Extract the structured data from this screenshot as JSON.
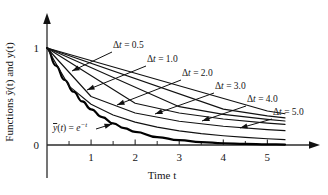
{
  "figure": {
    "background": "#ffffff",
    "ink": "#111111"
  },
  "chart_data": {
    "type": "line",
    "title": "",
    "xlabel": "Time t",
    "ylabel": "Functions ȳ(t) and y(t)",
    "xlim": [
      0,
      5.4
    ],
    "ylim": [
      0,
      1.12
    ],
    "grid": false,
    "legend_position": "inline-annotations",
    "x_ticks_major": [
      1,
      2,
      3,
      4,
      5
    ],
    "x_ticks_minor": [
      0.5,
      1.5,
      2.5,
      3.5,
      4.5
    ],
    "x_tick_labels": [
      "1",
      "2",
      "3",
      "4",
      "5"
    ],
    "y_ticks_major": [
      0,
      1
    ],
    "y_tick_labels": [
      "0",
      "1"
    ],
    "series": [
      {
        "name": "ȳ(t) = e^-t",
        "label": "ȳ(t) = e⁻t",
        "style": "exact-bold",
        "x": [
          0,
          0.2,
          0.4,
          0.6,
          0.8,
          1.0,
          1.25,
          1.5,
          1.75,
          2.0,
          2.5,
          3.0,
          3.5,
          4.0,
          4.5,
          5.0,
          5.4
        ],
        "values": [
          1.0,
          0.819,
          0.67,
          0.549,
          0.449,
          0.368,
          0.287,
          0.223,
          0.174,
          0.135,
          0.082,
          0.05,
          0.03,
          0.018,
          0.011,
          0.007,
          0.0045
        ]
      },
      {
        "name": "Δt = 0.5",
        "label": "Δt = 0.5",
        "style": "euler",
        "x": [
          0,
          0.5,
          1.0,
          1.5,
          2.0,
          2.5,
          3.0,
          3.5,
          4.0,
          4.5,
          5.0,
          5.4
        ],
        "values": [
          1.0,
          0.607,
          0.42,
          0.31,
          0.236,
          0.184,
          0.146,
          0.117,
          0.095,
          0.078,
          0.064,
          0.055
        ]
      },
      {
        "name": "Δt = 1.0",
        "label": "Δt = 1.0",
        "style": "euler",
        "x": [
          0,
          1.0,
          2.0,
          3.0,
          4.0,
          5.0,
          5.4
        ],
        "values": [
          1.0,
          0.5,
          0.33,
          0.245,
          0.193,
          0.159,
          0.148
        ]
      },
      {
        "name": "Δt = 2.0",
        "label": "Δt = 2.0",
        "style": "euler",
        "x": [
          0,
          2.0,
          3.0,
          4.0,
          5.0,
          5.4
        ],
        "values": [
          1.0,
          0.43,
          0.33,
          0.268,
          0.226,
          0.212
        ]
      },
      {
        "name": "Δt = 3.0",
        "label": "Δt = 3.0",
        "style": "euler",
        "x": [
          0,
          3.0,
          4.0,
          5.0,
          5.4
        ],
        "values": [
          1.0,
          0.395,
          0.315,
          0.264,
          0.247
        ]
      },
      {
        "name": "Δt = 4.0",
        "label": "Δt = 4.0",
        "style": "euler",
        "x": [
          0,
          4.0,
          5.0,
          5.4
        ],
        "values": [
          1.0,
          0.37,
          0.3,
          0.279
        ]
      },
      {
        "name": "Δt = 5.0",
        "label": "Δt = 5.0",
        "style": "euler",
        "x": [
          0,
          5.0,
          5.4
        ],
        "values": [
          1.0,
          0.35,
          0.322
        ]
      }
    ],
    "annotations": [
      {
        "text": "Δt = 0.5",
        "label_x": 113,
        "label_y": 48,
        "leader_from_x": 112,
        "leader_from_y": 52,
        "leader_to_x": 72,
        "leader_to_y": 71
      },
      {
        "text": "Δt = 1.0",
        "label_x": 147,
        "label_y": 62,
        "leader_from_x": 146,
        "leader_from_y": 66,
        "leader_to_x": 87,
        "leader_to_y": 90
      },
      {
        "text": "Δt = 2.0",
        "label_x": 182,
        "label_y": 76,
        "leader_from_x": 181,
        "leader_from_y": 80,
        "leader_to_x": 117,
        "leader_to_y": 105
      },
      {
        "text": "Δt = 3.0",
        "label_x": 215,
        "label_y": 89,
        "leader_from_x": 214,
        "leader_from_y": 93,
        "leader_to_x": 155,
        "leader_to_y": 114
      },
      {
        "text": "Δt = 4.0",
        "label_x": 247,
        "label_y": 102,
        "leader_from_x": 246,
        "leader_from_y": 106,
        "leader_to_x": 202,
        "leader_to_y": 121
      },
      {
        "text": "Δt = 5.0",
        "label_x": 273,
        "label_y": 115,
        "leader_from_x": 272,
        "leader_from_y": 119,
        "leader_to_x": 240,
        "leader_to_y": 128
      }
    ],
    "equation_annotation": {
      "text_main": "ȳ(t) = e",
      "text_exp": "−t",
      "label_x": 53,
      "label_y": 131,
      "leader_from_x": 96,
      "leader_from_y": 129,
      "leader_to_x": 112,
      "leader_to_y": 124
    }
  }
}
